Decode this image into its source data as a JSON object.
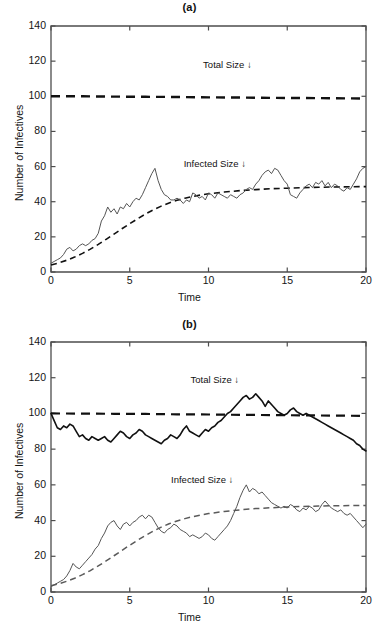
{
  "figure": {
    "background": "#ffffff",
    "axis_color": "#4d4d4d",
    "ink_color": "#111111",
    "curve_gray": "#5a5a5a"
  },
  "panels": [
    {
      "id": "a",
      "title": "(a)",
      "xlabel": "Time",
      "ylabel": "Number of Infectives",
      "yticks": [
        "0",
        "20",
        "40",
        "60",
        "80",
        "100",
        "120",
        "140"
      ],
      "xticks": [
        "0",
        "5",
        "10",
        "15",
        "20"
      ],
      "annotations": [
        {
          "text": "Total Size ↓",
          "x": 11.2,
          "y": 117
        },
        {
          "text": "Infected Size ↓",
          "x": 10.4,
          "y": 61
        }
      ]
    },
    {
      "id": "b",
      "title": "(b)",
      "xlabel": "Time",
      "ylabel": "Number of Infectives",
      "yticks": [
        "0",
        "20",
        "40",
        "60",
        "80",
        "100",
        "120",
        "140"
      ],
      "xticks": [
        "0",
        "5",
        "10",
        "15",
        "20"
      ],
      "annotations": [
        {
          "text": "Total Size ↓",
          "x": 10.4,
          "y": 118
        },
        {
          "text": "Infected Size ↓",
          "x": 9.6,
          "y": 62
        }
      ]
    }
  ],
  "chart_data": [
    {
      "type": "line",
      "title": "(a)",
      "xlabel": "Time",
      "ylabel": "Number of Infectives",
      "xlim": [
        0,
        20
      ],
      "ylim": [
        0,
        140
      ],
      "xticks": [
        0,
        5,
        10,
        15,
        20
      ],
      "yticks": [
        0,
        20,
        40,
        60,
        80,
        100,
        120,
        140
      ],
      "grid": false,
      "legend": "none",
      "annotations": [
        "Total Size ↓",
        "Infected Size ↓"
      ],
      "series": [
        {
          "name": "Total Size (deterministic)",
          "style": "dashed",
          "color": "#111111",
          "width": 2.4,
          "x": [
            0,
            2,
            4,
            6,
            8,
            10,
            12,
            14,
            16,
            18,
            20
          ],
          "values": [
            100,
            100,
            99.8,
            99.7,
            99.6,
            99.4,
            99.3,
            99.1,
            99.0,
            98.9,
            98.7
          ]
        },
        {
          "name": "Infected Size (deterministic)",
          "style": "dashed",
          "color": "#111111",
          "width": 1.6,
          "x": [
            0,
            0.5,
            1,
            1.5,
            2,
            2.5,
            3,
            3.5,
            4,
            4.5,
            5,
            5.5,
            6,
            6.5,
            7,
            7.5,
            8,
            8.5,
            9,
            9.5,
            10,
            11,
            12,
            13,
            14,
            15,
            16,
            17,
            18,
            19,
            20
          ],
          "values": [
            4,
            5.2,
            6.7,
            8.5,
            10.6,
            13.0,
            15.7,
            18.6,
            21.6,
            24.6,
            27.5,
            30.3,
            33.0,
            35.4,
            37.5,
            39.3,
            40.8,
            42.0,
            43.0,
            43.8,
            44.5,
            45.5,
            46.3,
            46.9,
            47.4,
            47.7,
            48.0,
            48.2,
            48.4,
            48.5,
            48.6
          ]
        },
        {
          "name": "Infected Size (stochastic realization)",
          "style": "solid",
          "color": "#555555",
          "width": 1.0,
          "x": [
            0,
            0.2,
            0.4,
            0.6,
            0.8,
            1.0,
            1.2,
            1.4,
            1.6,
            1.8,
            2.0,
            2.2,
            2.4,
            2.6,
            2.8,
            3.0,
            3.2,
            3.4,
            3.6,
            3.8,
            4.0,
            4.2,
            4.4,
            4.6,
            4.8,
            5.0,
            5.2,
            5.4,
            5.6,
            5.8,
            6.0,
            6.2,
            6.4,
            6.6,
            6.8,
            7.0,
            7.2,
            7.4,
            7.6,
            7.8,
            8.0,
            8.2,
            8.4,
            8.6,
            8.8,
            9.0,
            9.2,
            9.4,
            9.6,
            9.8,
            10.0,
            10.2,
            10.4,
            10.6,
            10.8,
            11.0,
            11.2,
            11.4,
            11.6,
            11.8,
            12.0,
            12.2,
            12.4,
            12.6,
            12.8,
            13.0,
            13.2,
            13.4,
            13.6,
            13.8,
            14.0,
            14.2,
            14.4,
            14.6,
            14.8,
            15.0,
            15.2,
            15.4,
            15.6,
            15.8,
            16.0,
            16.2,
            16.4,
            16.6,
            16.8,
            17.0,
            17.2,
            17.4,
            17.6,
            17.8,
            18.0,
            18.2,
            18.4,
            18.6,
            18.8,
            19.0,
            19.2,
            19.4,
            19.6,
            19.8,
            20.0
          ],
          "values": [
            5,
            6,
            7,
            8,
            10,
            13,
            14,
            12,
            13,
            15,
            16,
            15,
            16,
            18,
            19,
            22,
            29,
            32,
            37,
            34,
            36,
            33,
            37,
            36,
            39,
            37,
            40,
            42,
            41,
            44,
            48,
            52,
            56,
            59,
            52,
            47,
            44,
            43,
            41,
            41,
            42,
            41,
            39,
            41,
            40,
            45,
            44,
            42,
            43,
            41,
            45,
            44,
            42,
            45,
            44,
            43,
            42,
            44,
            43,
            42,
            44,
            45,
            47,
            48,
            47,
            50,
            52,
            55,
            57,
            58,
            56,
            59,
            58,
            55,
            52,
            50,
            44,
            43,
            42,
            45,
            47,
            49,
            50,
            48,
            51,
            50,
            52,
            49,
            51,
            48,
            50,
            49,
            47,
            46,
            48,
            47,
            50,
            53,
            57,
            59,
            60
          ]
        }
      ]
    },
    {
      "type": "line",
      "title": "(b)",
      "xlabel": "Time",
      "ylabel": "Number of Infectives",
      "xlim": [
        0,
        20
      ],
      "ylim": [
        0,
        140
      ],
      "xticks": [
        0,
        5,
        10,
        15,
        20
      ],
      "yticks": [
        0,
        20,
        40,
        60,
        80,
        100,
        120,
        140
      ],
      "grid": false,
      "legend": "none",
      "annotations": [
        "Total Size ↓",
        "Infected Size ↓"
      ],
      "series": [
        {
          "name": "Total Size (deterministic)",
          "style": "dashed",
          "color": "#111111",
          "width": 2.2,
          "x": [
            0,
            2,
            4,
            6,
            8,
            10,
            12,
            14,
            16,
            18,
            20
          ],
          "values": [
            100,
            99.9,
            99.8,
            99.7,
            99.5,
            99.4,
            99.2,
            99.1,
            98.9,
            98.8,
            98.6
          ]
        },
        {
          "name": "Total Size (stochastic realization)",
          "style": "solid",
          "color": "#111111",
          "width": 1.6,
          "x": [
            0,
            0.2,
            0.4,
            0.6,
            0.8,
            1.0,
            1.2,
            1.4,
            1.6,
            1.8,
            2.0,
            2.2,
            2.4,
            2.6,
            2.8,
            3.0,
            3.2,
            3.4,
            3.6,
            3.8,
            4.0,
            4.2,
            4.4,
            4.6,
            4.8,
            5.0,
            5.2,
            5.4,
            5.6,
            5.8,
            6.0,
            6.2,
            6.4,
            6.6,
            6.8,
            7.0,
            7.2,
            7.4,
            7.6,
            7.8,
            8.0,
            8.2,
            8.4,
            8.6,
            8.8,
            9.0,
            9.2,
            9.4,
            9.6,
            9.8,
            10.0,
            10.2,
            10.4,
            10.6,
            10.8,
            11.0,
            11.2,
            11.4,
            11.6,
            11.8,
            12.0,
            12.2,
            12.4,
            12.6,
            12.8,
            13.0,
            13.2,
            13.4,
            13.6,
            13.8,
            14.0,
            14.2,
            14.4,
            14.6,
            14.8,
            15.0,
            15.2,
            15.4,
            15.6,
            15.8,
            16.0,
            16.2,
            16.4,
            16.6,
            16.8,
            17.0,
            17.2,
            17.4,
            17.6,
            17.8,
            18.0,
            18.2,
            18.4,
            18.6,
            18.8,
            19.0,
            19.2,
            19.4,
            19.6,
            19.8,
            20.0
          ],
          "values": [
            100,
            96,
            92,
            91,
            93,
            92,
            94,
            93,
            90,
            87,
            88,
            86,
            85,
            87,
            86,
            85,
            86,
            87,
            85,
            84,
            86,
            88,
            90,
            89,
            87,
            86,
            88,
            89,
            91,
            90,
            88,
            87,
            86,
            85,
            84,
            83,
            85,
            86,
            88,
            87,
            86,
            88,
            91,
            93,
            90,
            89,
            88,
            87,
            89,
            91,
            90,
            92,
            93,
            95,
            96,
            98,
            100,
            101,
            103,
            105,
            107,
            109,
            110,
            108,
            109,
            111,
            109,
            107,
            104,
            107,
            105,
            103,
            101,
            100,
            99,
            100,
            102,
            103,
            101,
            100,
            99,
            100,
            99,
            98,
            97,
            96,
            95,
            94,
            93,
            92,
            91,
            90,
            89,
            88,
            87,
            86,
            85,
            83,
            82,
            80,
            79
          ]
        },
        {
          "name": "Infected Size (deterministic)",
          "style": "dashed",
          "color": "#5a5a5a",
          "width": 1.5,
          "x": [
            0,
            0.5,
            1,
            1.5,
            2,
            2.5,
            3,
            3.5,
            4,
            4.5,
            5,
            5.5,
            6,
            6.5,
            7,
            7.5,
            8,
            8.5,
            9,
            9.5,
            10,
            11,
            12,
            13,
            14,
            15,
            16,
            17,
            18,
            19,
            20
          ],
          "values": [
            3.5,
            4.6,
            6.0,
            7.7,
            9.7,
            12.0,
            14.6,
            17.4,
            20.3,
            23.3,
            26.2,
            29.0,
            31.7,
            34.1,
            36.3,
            38.2,
            39.8,
            41.1,
            42.2,
            43.1,
            43.9,
            45.1,
            46.0,
            46.7,
            47.2,
            47.6,
            47.9,
            48.1,
            48.3,
            48.4,
            48.5
          ]
        },
        {
          "name": "Infected Size (stochastic realization)",
          "style": "solid",
          "color": "#555555",
          "width": 1.0,
          "x": [
            0,
            0.2,
            0.4,
            0.6,
            0.8,
            1.0,
            1.2,
            1.4,
            1.6,
            1.8,
            2.0,
            2.2,
            2.4,
            2.6,
            2.8,
            3.0,
            3.2,
            3.4,
            3.6,
            3.8,
            4.0,
            4.2,
            4.4,
            4.6,
            4.8,
            5.0,
            5.2,
            5.4,
            5.6,
            5.8,
            6.0,
            6.2,
            6.4,
            6.6,
            6.8,
            7.0,
            7.2,
            7.4,
            7.6,
            7.8,
            8.0,
            8.2,
            8.4,
            8.6,
            8.8,
            9.0,
            9.2,
            9.4,
            9.6,
            9.8,
            10.0,
            10.2,
            10.4,
            10.6,
            10.8,
            11.0,
            11.2,
            11.4,
            11.6,
            11.8,
            12.0,
            12.2,
            12.4,
            12.6,
            12.8,
            13.0,
            13.2,
            13.4,
            13.6,
            13.8,
            14.0,
            14.2,
            14.4,
            14.6,
            14.8,
            15.0,
            15.2,
            15.4,
            15.6,
            15.8,
            16.0,
            16.2,
            16.4,
            16.6,
            16.8,
            17.0,
            17.2,
            17.4,
            17.6,
            17.8,
            18.0,
            18.2,
            18.4,
            18.6,
            18.8,
            19.0,
            19.2,
            19.4,
            19.6,
            19.8,
            20.0
          ],
          "values": [
            3,
            4,
            5,
            6,
            7,
            9,
            12,
            16,
            14,
            13,
            15,
            17,
            19,
            21,
            24,
            26,
            30,
            33,
            37,
            39,
            40,
            37,
            35,
            38,
            39,
            37,
            39,
            40,
            42,
            43,
            41,
            43,
            42,
            39,
            36,
            34,
            33,
            35,
            36,
            38,
            37,
            35,
            34,
            33,
            31,
            32,
            31,
            30,
            31,
            33,
            32,
            30,
            29,
            31,
            33,
            35,
            37,
            40,
            44,
            48,
            53,
            57,
            60,
            56,
            58,
            57,
            55,
            56,
            54,
            52,
            50,
            49,
            48,
            47,
            48,
            47,
            49,
            48,
            46,
            45,
            47,
            46,
            48,
            47,
            45,
            46,
            49,
            51,
            49,
            47,
            46,
            45,
            46,
            44,
            43,
            44,
            42,
            40,
            38,
            36,
            38
          ]
        }
      ]
    }
  ]
}
